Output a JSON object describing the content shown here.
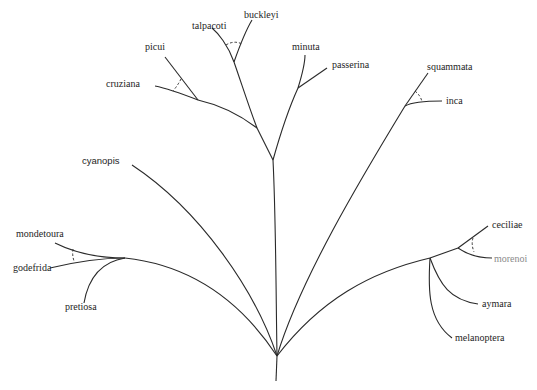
{
  "diagram": {
    "type": "phylogenetic-tree",
    "colors": {
      "line": "#2a2a2a",
      "text": "#1e1e1e",
      "background": "#ffffff"
    },
    "taxa": [
      {
        "id": "buckleyi",
        "label": "buckleyi"
      },
      {
        "id": "talpacoti",
        "label": "talpacoti"
      },
      {
        "id": "picui",
        "label": "picui"
      },
      {
        "id": "minuta",
        "label": "minuta"
      },
      {
        "id": "passerina",
        "label": "passerina"
      },
      {
        "id": "cruziana",
        "label": "cruziana"
      },
      {
        "id": "squammata",
        "label": "squammata"
      },
      {
        "id": "inca",
        "label": "inca"
      },
      {
        "id": "cyanopis",
        "label": "cyanopis"
      },
      {
        "id": "mondetoura",
        "label": "mondetoura"
      },
      {
        "id": "godefrida",
        "label": "godefrida"
      },
      {
        "id": "pretiosa",
        "label": "pretiosa"
      },
      {
        "id": "ceciliae",
        "label": "ceciliae"
      },
      {
        "id": "morenoi",
        "label": "morenoi"
      },
      {
        "id": "aymara",
        "label": "aymara"
      },
      {
        "id": "melanoptera",
        "label": "melanoptera"
      }
    ]
  }
}
